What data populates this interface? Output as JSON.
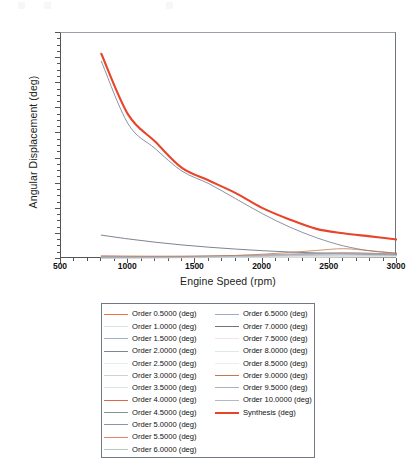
{
  "chart_data": {
    "type": "line",
    "title": "",
    "xlabel": "Engine Speed (rpm)",
    "ylabel": "Angular Displacement (deg)",
    "xlim": [
      500,
      3000
    ],
    "ylim": [
      0,
      1.8
    ],
    "xticks": [
      500,
      1000,
      1500,
      2000,
      2500,
      3000
    ],
    "yticks": [
      0,
      0.2,
      0.4,
      0.6,
      0.8,
      1,
      1.2,
      1.4,
      1.6,
      1.8
    ],
    "xtick_labels": [
      "500",
      "1000",
      "1500",
      "2000",
      "2500",
      "3000"
    ],
    "ytick_labels": [
      "0",
      "0.2",
      "0.4",
      "0.6",
      "0.8",
      "1",
      "1.2",
      "1.4",
      "1.6",
      "1.8"
    ],
    "grid": false,
    "legend_position": "below-plot",
    "x": [
      800,
      1000,
      1200,
      1400,
      1600,
      1800,
      2000,
      2200,
      2400,
      2600,
      2800,
      3000
    ],
    "series": [
      {
        "name": "Order 0.5000 (deg)",
        "color": "#e8734a",
        "width": 0.7,
        "values": [
          0.02,
          0.018,
          0.017,
          0.016,
          0.016,
          0.015,
          0.015,
          0.016,
          0.018,
          0.02,
          0.022,
          0.024
        ]
      },
      {
        "name": "Order 1.0000 (deg)",
        "color": "#d8e4e0",
        "width": 0.7,
        "values": [
          0.014,
          0.013,
          0.013,
          0.012,
          0.012,
          0.012,
          0.013,
          0.014,
          0.015,
          0.016,
          0.017,
          0.018
        ]
      },
      {
        "name": "Order 1.5000 (deg)",
        "color": "#9bb4cf",
        "width": 0.7,
        "values": [
          0.022,
          0.02,
          0.019,
          0.018,
          0.018,
          0.018,
          0.019,
          0.021,
          0.024,
          0.027,
          0.03,
          0.032
        ]
      },
      {
        "name": "Order 2.0000 (deg)",
        "color": "#7d8794",
        "width": 0.9,
        "values": [
          1.575,
          1.075,
          0.88,
          0.7,
          0.6,
          0.48,
          0.36,
          0.255,
          0.17,
          0.105,
          0.065,
          0.045
        ]
      },
      {
        "name": "Order 2.5000 (deg)",
        "color": "#e3eef0",
        "width": 0.7,
        "values": [
          0.012,
          0.012,
          0.011,
          0.011,
          0.011,
          0.012,
          0.012,
          0.013,
          0.014,
          0.015,
          0.016,
          0.017
        ]
      },
      {
        "name": "Order 3.0000 (deg)",
        "color": "#c8d4cc",
        "width": 0.7,
        "values": [
          0.016,
          0.015,
          0.015,
          0.015,
          0.016,
          0.017,
          0.018,
          0.02,
          0.022,
          0.024,
          0.026,
          0.028
        ]
      },
      {
        "name": "Order 3.5000 (deg)",
        "color": "#dce6e2",
        "width": 0.7,
        "values": [
          0.01,
          0.01,
          0.01,
          0.011,
          0.011,
          0.012,
          0.013,
          0.014,
          0.015,
          0.016,
          0.017,
          0.018
        ]
      },
      {
        "name": "Order 4.0000 (deg)",
        "color": "#d86a4a",
        "width": 0.7,
        "values": [
          0.026,
          0.024,
          0.023,
          0.023,
          0.024,
          0.026,
          0.029,
          0.034,
          0.042,
          0.05,
          0.046,
          0.04
        ]
      },
      {
        "name": "Order 4.5000 (deg)",
        "color": "#7d9b8c",
        "width": 0.7,
        "values": [
          0.013,
          0.013,
          0.013,
          0.014,
          0.015,
          0.016,
          0.018,
          0.02,
          0.023,
          0.026,
          0.027,
          0.027
        ]
      },
      {
        "name": "Order 5.0000 (deg)",
        "color": "#8a94a4",
        "width": 0.7,
        "values": [
          0.018,
          0.018,
          0.019,
          0.021,
          0.024,
          0.028,
          0.033,
          0.04,
          0.046,
          0.048,
          0.044,
          0.038
        ]
      },
      {
        "name": "Order 5.5000 (deg)",
        "color": "#e8836a",
        "width": 0.7,
        "values": [
          0.011,
          0.011,
          0.012,
          0.013,
          0.014,
          0.016,
          0.018,
          0.021,
          0.025,
          0.028,
          0.028,
          0.026
        ]
      },
      {
        "name": "Order 6.0000 (deg)",
        "color": "#b9c8c2",
        "width": 0.7,
        "values": [
          0.009,
          0.01,
          0.01,
          0.011,
          0.012,
          0.014,
          0.016,
          0.019,
          0.022,
          0.024,
          0.024,
          0.022
        ]
      },
      {
        "name": "Order 6.5000 (deg)",
        "color": "#9aacc4",
        "width": 0.7,
        "values": [
          0.014,
          0.015,
          0.016,
          0.018,
          0.02,
          0.023,
          0.027,
          0.032,
          0.037,
          0.039,
          0.036,
          0.032
        ]
      },
      {
        "name": "Order 7.0000 (deg)",
        "color": "#6e7682",
        "width": 0.9,
        "values": [
          0.19,
          0.16,
          0.134,
          0.112,
          0.094,
          0.079,
          0.066,
          0.056,
          0.048,
          0.042,
          0.038,
          0.036
        ]
      },
      {
        "name": "Order 7.5000 (deg)",
        "color": "#f0e6e2",
        "width": 0.7,
        "values": [
          0.008,
          0.009,
          0.01,
          0.011,
          0.012,
          0.014,
          0.016,
          0.018,
          0.02,
          0.021,
          0.021,
          0.02
        ]
      },
      {
        "name": "Order 8.0000 (deg)",
        "color": "#dfe8e4",
        "width": 0.7,
        "values": [
          0.01,
          0.011,
          0.012,
          0.013,
          0.015,
          0.017,
          0.02,
          0.023,
          0.026,
          0.028,
          0.027,
          0.025
        ]
      },
      {
        "name": "Order 8.5000 (deg)",
        "color": "#e6eef0",
        "width": 0.7,
        "values": [
          0.009,
          0.01,
          0.011,
          0.012,
          0.014,
          0.016,
          0.018,
          0.021,
          0.024,
          0.025,
          0.024,
          0.022
        ]
      },
      {
        "name": "Order 9.0000 (deg)",
        "color": "#c07a52",
        "width": 0.8,
        "values": [
          0.012,
          0.013,
          0.015,
          0.018,
          0.022,
          0.028,
          0.038,
          0.052,
          0.068,
          0.082,
          0.066,
          0.046
        ]
      },
      {
        "name": "Order 9.5000 (deg)",
        "color": "#a8b2bc",
        "width": 0.7,
        "values": [
          0.01,
          0.011,
          0.012,
          0.014,
          0.017,
          0.021,
          0.026,
          0.033,
          0.04,
          0.044,
          0.04,
          0.034
        ]
      },
      {
        "name": "Order 10.0000 (deg)",
        "color": "#b0bac4",
        "width": 0.7,
        "values": [
          0.008,
          0.009,
          0.01,
          0.012,
          0.014,
          0.017,
          0.021,
          0.026,
          0.031,
          0.034,
          0.032,
          0.028
        ]
      },
      {
        "name": "Synthesis (deg)",
        "color": "#e8442a",
        "width": 2.1,
        "values": [
          1.635,
          1.15,
          0.935,
          0.725,
          0.625,
          0.525,
          0.405,
          0.315,
          0.24,
          0.205,
          0.18,
          0.155
        ]
      }
    ]
  },
  "legend": {
    "left_column": [
      "Order  0.5000 (deg)",
      "Order  1.0000 (deg)",
      "Order  1.5000 (deg)",
      "Order  2.0000 (deg)",
      "Order  2.5000 (deg)",
      "Order  3.0000 (deg)",
      "Order  3.5000 (deg)",
      "Order  4.0000 (deg)",
      "Order  4.5000 (deg)",
      "Order  5.0000 (deg)",
      "Order  5.5000 (deg)",
      "Order  6.0000 (deg)"
    ],
    "right_column": [
      "Order  6.5000 (deg)",
      "Order  7.0000 (deg)",
      "Order  7.5000 (deg)",
      "Order  8.0000 (deg)",
      "Order  8.5000 (deg)",
      "Order  9.0000 (deg)",
      "Order  9.5000 (deg)",
      "Order 10.0000 (deg)",
      "Synthesis (deg)"
    ]
  },
  "colors": {
    "synthesis": "#e8442a",
    "order2": "#7d8794",
    "order7": "#6e7682",
    "axis": "#555555",
    "frame": "#6d7480"
  }
}
